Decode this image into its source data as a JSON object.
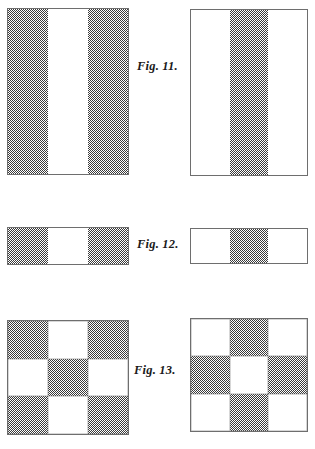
{
  "page": {
    "background_color": "#ffffff",
    "width": 315,
    "height": 449,
    "shade_color": "#3a3a3a",
    "border_color": "#6e6e6e"
  },
  "figures": [
    {
      "caption": "Fig. 11.",
      "caption_x": 137,
      "caption_y": 60,
      "left_panel": {
        "name": "fig11-left-panel",
        "x": 7,
        "y": 8,
        "width": 122,
        "height": 167,
        "layout": "columns",
        "cells": [
          "shaded",
          "white",
          "shaded"
        ]
      },
      "right_panel": {
        "name": "fig11-right-panel",
        "x": 190,
        "y": 9,
        "width": 118,
        "height": 167,
        "layout": "columns",
        "cells": [
          "white",
          "shaded",
          "white"
        ]
      }
    },
    {
      "caption": "Fig. 12.",
      "caption_x": 137,
      "caption_y": 238,
      "left_panel": {
        "name": "fig12-left-panel",
        "x": 7,
        "y": 227,
        "width": 122,
        "height": 38,
        "layout": "columns",
        "cells": [
          "shaded",
          "white",
          "shaded"
        ]
      },
      "right_panel": {
        "name": "fig12-right-panel",
        "x": 190,
        "y": 228,
        "width": 118,
        "height": 36,
        "layout": "columns",
        "cells": [
          "white",
          "shaded",
          "white"
        ]
      }
    },
    {
      "caption": "Fig. 13.",
      "caption_x": 134,
      "caption_y": 364,
      "left_panel": {
        "name": "fig13-left-panel",
        "x": 7,
        "y": 320,
        "width": 122,
        "height": 115,
        "layout": "grid3x3",
        "cells": [
          "shaded",
          "white",
          "shaded",
          "white",
          "shaded",
          "white",
          "shaded",
          "white",
          "shaded"
        ]
      },
      "right_panel": {
        "name": "fig13-right-panel",
        "x": 190,
        "y": 318,
        "width": 118,
        "height": 114,
        "layout": "grid3x3",
        "cells": [
          "white",
          "shaded",
          "white",
          "shaded",
          "white",
          "shaded",
          "white",
          "shaded",
          "white"
        ]
      }
    }
  ]
}
